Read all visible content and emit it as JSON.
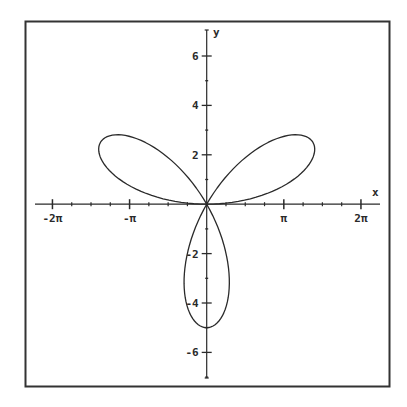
{
  "chart_data": {
    "type": "line",
    "subtype": "polar-parametric",
    "title": "",
    "equation": "r = 5 sin(3θ)",
    "curve": {
      "amplitude": 5,
      "petals": 3,
      "theta_range": [
        0,
        3.14159265
      ]
    },
    "xlabel": "x",
    "ylabel": "y",
    "xlim": [
      -7.0,
      7.0
    ],
    "ylim": [
      -7.0,
      6.9
    ],
    "x_ticks": [
      {
        "value": -6.2832,
        "label": "-2π"
      },
      {
        "value": -3.1416,
        "label": "-π"
      },
      {
        "value": 3.1416,
        "label": "π"
      },
      {
        "value": 6.2832,
        "label": "2π"
      }
    ],
    "x_minor_step": 0.7854,
    "y_ticks": [
      {
        "value": 6,
        "label": "6"
      },
      {
        "value": 4,
        "label": "4"
      },
      {
        "value": 2,
        "label": "2"
      },
      {
        "value": -2,
        "label": "-2"
      },
      {
        "value": -4,
        "label": "-4"
      },
      {
        "value": -6,
        "label": "-6"
      }
    ],
    "y_minor_step": 1,
    "grid": false,
    "legend": null,
    "petal_tips": [
      {
        "x": 4.33,
        "y": 2.5
      },
      {
        "x": -4.33,
        "y": 2.5
      },
      {
        "x": 0,
        "y": -5
      }
    ]
  },
  "colors": {
    "background": "#ffffff",
    "ink": "#2a2a2a",
    "frame": "#333333"
  }
}
